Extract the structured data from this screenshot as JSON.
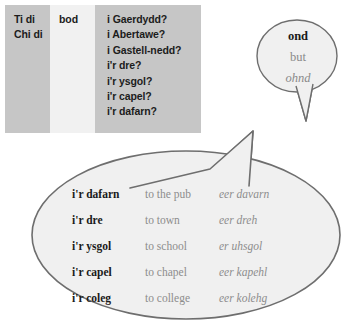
{
  "pattern_table": {
    "columns": [
      {
        "name": "subject",
        "shade": "#c6c6c6",
        "lines": [
          "Ti di",
          "Chi di"
        ]
      },
      {
        "name": "verb",
        "shade": "#f1f1f1",
        "lines": [
          "bod"
        ]
      },
      {
        "name": "place",
        "shade": "#c6c6c6",
        "lines": [
          "i Gaerdydd?",
          "i Abertawe?",
          "i Gastell-nedd?",
          "i'r dre?",
          "i'r ysgol?",
          "i'r capel?",
          "i'r dafarn?"
        ]
      }
    ]
  },
  "small_bubble": {
    "welsh": "ond",
    "english": "but",
    "pronunciation": "ohnd"
  },
  "large_bubble": {
    "rows": [
      {
        "welsh": "i'r dafarn",
        "english": "to the pub",
        "pronunciation": "eer davarn"
      },
      {
        "welsh": "i'r dre",
        "english": "to town",
        "pronunciation": "eer dreh"
      },
      {
        "welsh": "i'r ysgol",
        "english": "to school",
        "pronunciation": "er uhsgol"
      },
      {
        "welsh": "i'r capel",
        "english": "to chapel",
        "pronunciation": "eer kapehl"
      },
      {
        "welsh": "i'r coleg",
        "english": "to college",
        "pronunciation": "eer kolehg"
      }
    ]
  },
  "colors": {
    "table_dark": "#c6c6c6",
    "table_light": "#f1f1f1",
    "bubble_fill": "#f0f0f0",
    "bubble_stroke": "#6e6e6e",
    "text_primary": "#1a1a1a",
    "text_muted": "#8d8d8d"
  }
}
